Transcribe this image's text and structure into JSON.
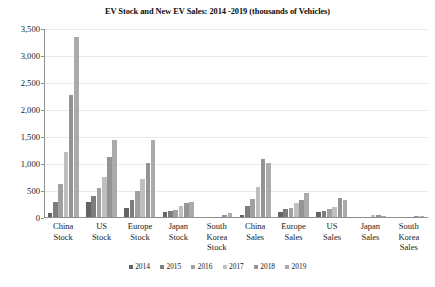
{
  "chart_data": {
    "type": "bar",
    "title": "EV Stock and New EV Sales: 2014 -2019 (thousands of Vehicles)",
    "xlabel": "",
    "ylabel": "",
    "ylim": [
      0,
      3500
    ],
    "ytick_step": 500,
    "grid": true,
    "legend_position": "bottom",
    "categories": [
      "China Stock",
      "US Stock",
      "Europe Stock",
      "Japan Stock",
      "South Korea Stock",
      "China Sales",
      "Europe Sales",
      "US Sales",
      "Japan Sales",
      "South Korea Sales"
    ],
    "category_lines": [
      [
        "China",
        "Stock"
      ],
      [
        "US",
        "Stock"
      ],
      [
        "Europe",
        "Stock"
      ],
      [
        "Japan",
        "Stock"
      ],
      [
        "South",
        "Korea",
        "Stock"
      ],
      [
        "China",
        "Sales"
      ],
      [
        "Europe",
        "Sales"
      ],
      [
        "US",
        "Sales"
      ],
      [
        "Japan",
        "Sales"
      ],
      [
        "South",
        "Korea",
        "Sales"
      ]
    ],
    "ytick_labels": [
      "0",
      "500",
      "1,000",
      "1,500",
      "2,000",
      "2,500",
      "3,000",
      "3,500"
    ],
    "ytick_values": [
      0,
      500,
      1000,
      1500,
      2000,
      2500,
      3000,
      3500
    ],
    "series": [
      {
        "name": "2014",
        "color": "#646464",
        "values": [
          85,
          300,
          180,
          105,
          6,
          60,
          110,
          120,
          20,
          5
        ]
      },
      {
        "name": "2015",
        "color": "#7d7d7d",
        "values": [
          295,
          400,
          340,
          125,
          10,
          220,
          160,
          125,
          22,
          7
        ]
      },
      {
        "name": "2016",
        "color": "#a0a0a0",
        "values": [
          625,
          565,
          500,
          150,
          18,
          350,
          185,
          160,
          25,
          10
        ]
      },
      {
        "name": "2017",
        "color": "#bfbfbf",
        "values": [
          1215,
          760,
          725,
          215,
          28,
          580,
          270,
          205,
          55,
          14
        ]
      },
      {
        "name": "2018",
        "color": "#949494",
        "values": [
          2285,
          1125,
          1025,
          280,
          57,
          1085,
          330,
          365,
          50,
          33
        ]
      },
      {
        "name": "2019",
        "color": "#ababab",
        "values": [
          3350,
          1450,
          1450,
          305,
          90,
          1020,
          465,
          340,
          45,
          35
        ]
      }
    ]
  }
}
